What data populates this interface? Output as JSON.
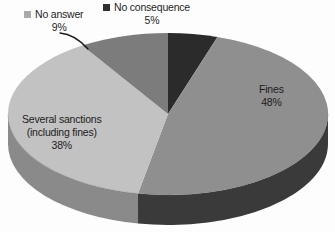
{
  "chart_data": {
    "type": "pie",
    "title": "",
    "subtitle": "",
    "xlabel": "",
    "ylabel": "",
    "grid": false,
    "legend_position": "top",
    "three_d": true,
    "start_angle_deg": 0,
    "direction": "clockwise",
    "categories": [
      "No consequence",
      "Fines",
      "Several sanctions (including fines)",
      "No answer"
    ],
    "values": [
      5,
      48,
      38,
      9
    ],
    "value_unit": "percent",
    "slices": [
      {
        "name": "No consequence",
        "label": "No consequence",
        "value": 5,
        "value_text": "5%",
        "color": "#2b2b2b",
        "side_color": "#1a1a1a",
        "label_placement": "external-legend"
      },
      {
        "name": "Fines",
        "label": "Fines",
        "value": 48,
        "value_text": "48%",
        "color": "#8f8f8f",
        "side_color": "#3a3a3a",
        "label_placement": "inside"
      },
      {
        "name": "Several sanctions (including fines)",
        "label_line1": "Several sanctions",
        "label_line2": "(including fines)",
        "value": 38,
        "value_text": "38%",
        "color": "#c2c2c2",
        "side_color": "#8a8a8a",
        "label_placement": "inside"
      },
      {
        "name": "No answer",
        "label": "No answer",
        "value": 9,
        "value_text": "9%",
        "color": "#7c7c7c",
        "side_color": "#5e5e5e",
        "label_placement": "external-legend-with-leader"
      }
    ]
  },
  "legend": {
    "entries": [
      {
        "label": "No answer",
        "value_text": "9%",
        "swatch_color": "#a9a9a9"
      },
      {
        "label": "No consequence",
        "value_text": "5%",
        "swatch_color": "#2f2f2f"
      }
    ]
  },
  "inner_labels": {
    "fines": {
      "label": "Fines",
      "value_text": "48%"
    },
    "several_sanctions": {
      "line1": "Several sanctions",
      "line2": "(including fines)",
      "value_text": "38%"
    }
  },
  "colors": {
    "background": "#fdfdfd",
    "text": "#1d1d1d",
    "fines": "#8f8f8f",
    "several_sanctions": "#c2c2c2",
    "no_answer": "#7c7c7c",
    "no_consequence": "#2b2b2b",
    "leader_line": "#1a1a1a"
  }
}
